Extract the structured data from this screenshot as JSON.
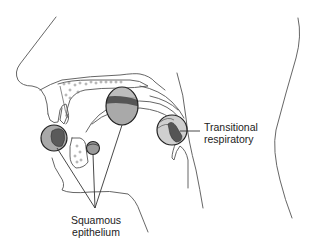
{
  "figure": {
    "labels": {
      "transitional": {
        "line1": "Transitional",
        "line2": "respiratory"
      },
      "squamous": {
        "line1": "Squamous",
        "line2": "epithelium"
      }
    },
    "regions": [
      {
        "name": "nasal-vestibule-region",
        "epithelium": "Squamous epithelium"
      },
      {
        "name": "oral-lip-region",
        "epithelium": "Squamous epithelium"
      },
      {
        "name": "oropharynx-region",
        "epithelium": "Squamous epithelium"
      },
      {
        "name": "larynx-region",
        "epithelium": "Transitional respiratory"
      }
    ],
    "colors": {
      "line": "#555555",
      "circle_fill_light": "#c8c8c8",
      "circle_fill_mid": "#a9a9a9",
      "circle_fill_dark": "#555555",
      "circle_stroke": "#222222",
      "text": "#222222",
      "background": "#ffffff"
    }
  }
}
